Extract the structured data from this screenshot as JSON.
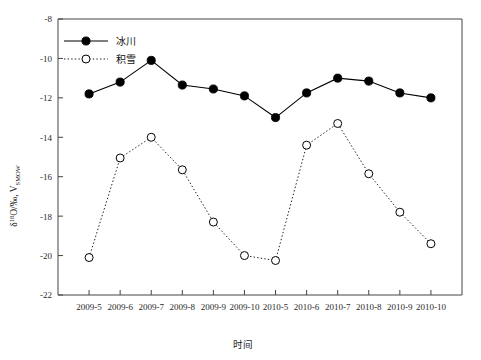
{
  "chart_data": {
    "type": "line",
    "title": "",
    "xlabel": "时间",
    "ylabel": "δ18O/‰, VSMOW",
    "ylabel_parts": {
      "delta": "δ",
      "sup": "18",
      "o_slash_permille": "O/‰, V",
      "sub": "SMOW"
    },
    "categories": [
      "2009-5",
      "2009-6",
      "2009-7",
      "2009-8",
      "2009-9",
      "2009-10",
      "2010-5",
      "2010-6",
      "2010-7",
      "2010-8",
      "2010-9",
      "2010-10"
    ],
    "ylim": [
      -22,
      -8
    ],
    "yticks": [
      -8,
      -10,
      -12,
      -14,
      -16,
      -18,
      -20,
      -22
    ],
    "ytick_labels": [
      "-8",
      "-10",
      "-12",
      "-14",
      "-16",
      "-18",
      "-20",
      "-22"
    ],
    "grid": false,
    "legend_position": "top-left",
    "series": [
      {
        "name": "冰川",
        "marker": "filled-circle",
        "line_style": "solid",
        "color": "#000000",
        "values": [
          -11.8,
          -11.2,
          -10.1,
          -11.35,
          -11.55,
          -11.9,
          -13.0,
          -11.75,
          -11.0,
          -11.15,
          -11.75,
          -12.0
        ]
      },
      {
        "name": "积雪",
        "marker": "open-circle",
        "line_style": "dotted",
        "color": "#000000",
        "values": [
          -20.1,
          -15.05,
          -14.0,
          -15.65,
          -18.3,
          -20.0,
          -20.25,
          -14.4,
          -13.3,
          -15.85,
          -17.8,
          -19.4
        ]
      }
    ]
  },
  "legend": {
    "items": [
      {
        "label": "冰川",
        "marker": "filled-circle",
        "line_style": "solid"
      },
      {
        "label": "积雪",
        "marker": "open-circle",
        "line_style": "dotted"
      }
    ]
  }
}
